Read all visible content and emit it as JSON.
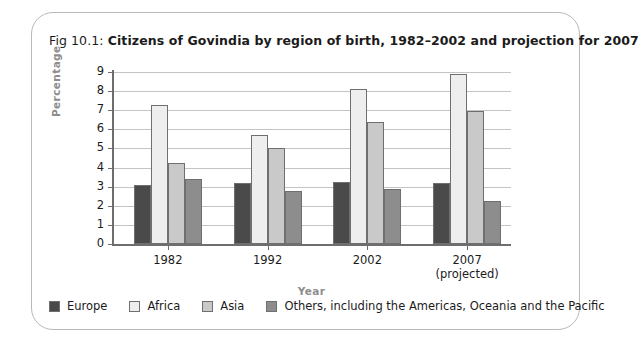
{
  "figure": {
    "number": "Fig 10.1:",
    "caption": "Citizens of Govindia by region of birth, 1982–2002 and projection for 2007"
  },
  "axes": {
    "y_title": "Percentage",
    "x_title": "Year"
  },
  "legend": {
    "items": [
      {
        "label": "Europe",
        "color": "#4a4a4a"
      },
      {
        "label": "Africa",
        "color": "#eeeeee"
      },
      {
        "label": "Asia",
        "color": "#c9c9c9"
      },
      {
        "label": "Others, including the Americas, Oceania and the Pacific",
        "color": "#8d8d8d"
      }
    ]
  },
  "chart_data": {
    "type": "bar",
    "title": "Citizens of Govindia by region of birth, 1982–2002 and projection for 2007",
    "xlabel": "Year",
    "ylabel": "Percentage",
    "ylim": [
      0,
      9
    ],
    "yticks": [
      0,
      1,
      2,
      3,
      4,
      5,
      6,
      7,
      8,
      9
    ],
    "grid": true,
    "legend_position": "bottom",
    "categories": [
      "1982",
      "1992",
      "2002",
      "2007"
    ],
    "category_sublabels": [
      "",
      "",
      "",
      "(projected)"
    ],
    "series": [
      {
        "name": "Europe",
        "color": "#4a4a4a",
        "values": [
          3.1,
          3.2,
          3.25,
          3.2
        ]
      },
      {
        "name": "Africa",
        "color": "#eeeeee",
        "values": [
          7.3,
          5.7,
          8.1,
          8.9
        ]
      },
      {
        "name": "Asia",
        "color": "#c9c9c9",
        "values": [
          4.25,
          5.0,
          6.4,
          6.95
        ]
      },
      {
        "name": "Others, including the Americas, Oceania and the Pacific",
        "color": "#8d8d8d",
        "values": [
          3.4,
          2.75,
          2.9,
          2.25
        ]
      }
    ]
  }
}
